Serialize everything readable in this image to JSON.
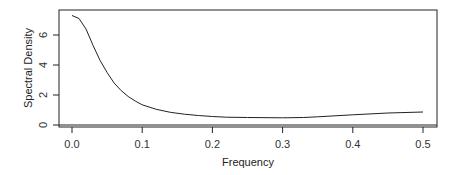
{
  "chart_data": {
    "type": "line",
    "title": "",
    "xlabel": "Frequency",
    "ylabel": "Spectral Density",
    "xlim": [
      -0.013,
      0.52
    ],
    "ylim": [
      -0.15,
      7.7
    ],
    "x_ticks": [
      "0.0",
      "0.1",
      "0.2",
      "0.3",
      "0.4",
      "0.5"
    ],
    "y_ticks": [
      "0",
      "2",
      "4",
      "6"
    ],
    "grid": false,
    "legend": null,
    "reference_line": {
      "y": 0
    },
    "series": [
      {
        "name": "spectral density",
        "x": [
          0.0,
          0.01,
          0.02,
          0.03,
          0.04,
          0.05,
          0.06,
          0.07,
          0.08,
          0.09,
          0.1,
          0.12,
          0.14,
          0.16,
          0.18,
          0.2,
          0.22,
          0.25,
          0.3,
          0.33,
          0.35,
          0.4,
          0.45,
          0.5
        ],
        "values": [
          7.3,
          7.1,
          6.4,
          5.3,
          4.3,
          3.5,
          2.8,
          2.3,
          1.9,
          1.6,
          1.35,
          1.05,
          0.85,
          0.72,
          0.63,
          0.57,
          0.52,
          0.5,
          0.48,
          0.5,
          0.55,
          0.68,
          0.8,
          0.87
        ]
      }
    ]
  }
}
